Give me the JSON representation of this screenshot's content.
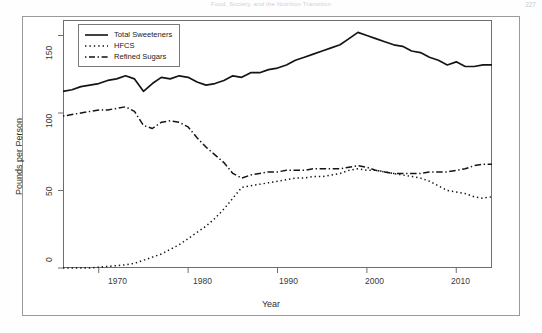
{
  "page": {
    "running_head": "Food, Society, and the Nutrition Transition",
    "folio": "227"
  },
  "legend": {
    "position": "top-left",
    "items": [
      {
        "label": "Total Sweeteners",
        "style": "solid"
      },
      {
        "label": "HFCS",
        "style": "dotted"
      },
      {
        "label": "Refined Sugars",
        "style": "dashdot"
      }
    ]
  },
  "axes": {
    "x_title": "Year",
    "y_title": "Pounds per Person",
    "x_ticks": [
      "1970",
      "1980",
      "1990",
      "2000",
      "2010"
    ],
    "y_ticks": [
      "0",
      "50",
      "100",
      "150"
    ]
  },
  "chart_data": {
    "type": "line",
    "title": "",
    "xlabel": "Year",
    "ylabel": "Pounds per Person",
    "xlim": [
      1966,
      2014
    ],
    "ylim": [
      0,
      160
    ],
    "grid": false,
    "legend_position": "top-left",
    "x": [
      1966,
      1967,
      1968,
      1969,
      1970,
      1971,
      1972,
      1973,
      1974,
      1975,
      1976,
      1977,
      1978,
      1979,
      1980,
      1981,
      1982,
      1983,
      1984,
      1985,
      1986,
      1987,
      1988,
      1989,
      1990,
      1991,
      1992,
      1993,
      1994,
      1995,
      1996,
      1997,
      1998,
      1999,
      2000,
      2001,
      2002,
      2003,
      2004,
      2005,
      2006,
      2007,
      2008,
      2009,
      2010,
      2011,
      2012,
      2013,
      2014
    ],
    "series": [
      {
        "name": "Total Sweeteners",
        "style": "solid",
        "values": [
          114,
          115,
          117,
          118,
          119,
          121,
          122,
          124,
          122,
          114,
          119,
          123,
          122,
          124,
          123,
          120,
          118,
          119,
          121,
          124,
          123,
          126,
          126,
          128,
          129,
          131,
          134,
          136,
          138,
          140,
          142,
          144,
          148,
          152,
          150,
          148,
          146,
          144,
          143,
          140,
          139,
          136,
          134,
          131,
          133,
          130,
          130,
          131,
          131
        ]
      },
      {
        "name": "HFCS",
        "style": "dotted",
        "values": [
          0,
          0,
          0,
          0,
          0.5,
          1,
          1.5,
          2,
          3,
          5,
          7,
          9,
          12,
          15,
          19,
          23,
          27,
          32,
          38,
          45,
          52,
          53,
          54,
          55,
          56,
          57,
          58,
          58,
          59,
          59,
          60,
          61,
          63,
          64,
          63,
          63,
          62,
          61,
          60,
          59,
          58,
          56,
          53,
          50,
          49,
          48,
          46,
          45,
          46
        ]
      },
      {
        "name": "Refined Sugars",
        "style": "dashdot",
        "values": [
          98,
          99,
          100,
          101,
          102,
          102,
          103,
          104,
          101,
          92,
          90,
          94,
          95,
          94,
          91,
          84,
          78,
          73,
          68,
          61,
          58,
          60,
          61,
          62,
          62,
          63,
          63,
          63,
          64,
          64,
          64,
          64,
          65,
          66,
          65,
          63,
          62,
          61,
          61,
          61,
          61,
          62,
          62,
          62,
          63,
          64,
          66,
          67,
          67
        ]
      }
    ]
  }
}
